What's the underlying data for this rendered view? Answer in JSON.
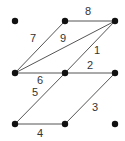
{
  "diagram": {
    "title": "",
    "nodes": [
      {
        "id": "a",
        "x": 15,
        "y": 21
      },
      {
        "id": "b",
        "x": 65,
        "y": 21
      },
      {
        "id": "c",
        "x": 115,
        "y": 21
      },
      {
        "id": "d",
        "x": 15,
        "y": 73
      },
      {
        "id": "e",
        "x": 65,
        "y": 73
      },
      {
        "id": "f",
        "x": 115,
        "y": 73
      },
      {
        "id": "g",
        "x": 15,
        "y": 124
      },
      {
        "id": "h",
        "x": 65,
        "y": 124
      },
      {
        "id": "i",
        "x": 115,
        "y": 124
      }
    ],
    "edges": [
      {
        "label": "1",
        "from": "e",
        "to": "c",
        "lx": 94,
        "ly": 54
      },
      {
        "label": "2",
        "from": "e",
        "to": "f",
        "lx": 87,
        "ly": 69
      },
      {
        "label": "3",
        "from": "h",
        "to": "f",
        "lx": 92,
        "ly": 111
      },
      {
        "label": "4",
        "from": "g",
        "to": "h",
        "lx": 37,
        "ly": 137
      },
      {
        "label": "5",
        "from": "g",
        "to": "e",
        "lx": 32,
        "ly": 96
      },
      {
        "label": "6",
        "from": "d",
        "to": "e",
        "lx": 37,
        "ly": 84
      },
      {
        "label": "7",
        "from": "d",
        "to": "b",
        "lx": 30,
        "ly": 42
      },
      {
        "label": "8",
        "from": "b",
        "to": "c",
        "lx": 85,
        "ly": 15
      },
      {
        "label": "9",
        "from": "d",
        "to": "c",
        "lx": 60,
        "ly": 42
      }
    ]
  }
}
